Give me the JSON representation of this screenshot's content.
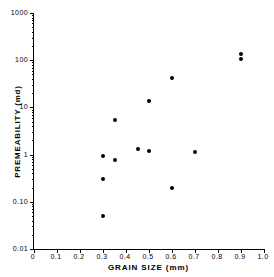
{
  "chart_data": {
    "type": "scatter",
    "title": "",
    "xlabel": "GRAIN SIZE (mm)",
    "ylabel": "PREMEABILITY (md)",
    "xlim": [
      0,
      1.0
    ],
    "ylim": [
      0.01,
      1000
    ],
    "yscale": "log",
    "xscale": "linear",
    "grid": false,
    "legend": null,
    "xticks": [
      "0",
      "0.1",
      "0.2",
      "0.3",
      "0.4",
      "0.5",
      "0.6",
      "0.7",
      "0.8",
      "0.9",
      "1.0"
    ],
    "xtick_values": [
      0,
      0.1,
      0.2,
      0.3,
      0.4,
      0.5,
      0.6,
      0.7,
      0.8,
      0.9,
      1.0
    ],
    "yticks": [
      "1000",
      "100",
      "10",
      "1",
      "0.10",
      "0.01"
    ],
    "ytick_values": [
      1000,
      100,
      10,
      1,
      0.1,
      0.01
    ],
    "marker": "filled-circle",
    "marker_color": "#000000",
    "points": [
      {
        "x": 0.3,
        "y": 0.95
      },
      {
        "x": 0.3,
        "y": 0.3
      },
      {
        "x": 0.3,
        "y": 0.05
      },
      {
        "x": 0.35,
        "y": 5.3
      },
      {
        "x": 0.35,
        "y": 0.75
      },
      {
        "x": 0.45,
        "y": 1.3
      },
      {
        "x": 0.5,
        "y": 14.0
      },
      {
        "x": 0.5,
        "y": 1.2
      },
      {
        "x": 0.6,
        "y": 43.0
      },
      {
        "x": 0.6,
        "y": 0.2
      },
      {
        "x": 0.7,
        "y": 1.15
      },
      {
        "x": 0.9,
        "y": 135.0
      },
      {
        "x": 0.9,
        "y": 105.0
      }
    ]
  },
  "figure": {
    "background_color": "#ffffff",
    "axis_color": "#000000"
  }
}
